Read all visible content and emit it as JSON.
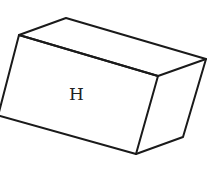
{
  "diagram": {
    "type": "rectangular-prism",
    "face_label": "H",
    "stroke_color": "#1a1a1a",
    "background": "#ffffff",
    "vertices": {
      "top_back": [
        66,
        18
      ],
      "top_left": [
        19,
        35
      ],
      "top_right": [
        206,
        59
      ],
      "top_front_right": [
        158,
        76
      ],
      "bottom_left": [
        0,
        116
      ],
      "bottom_front": [
        136,
        154
      ],
      "bottom_right": [
        183,
        137
      ]
    }
  }
}
